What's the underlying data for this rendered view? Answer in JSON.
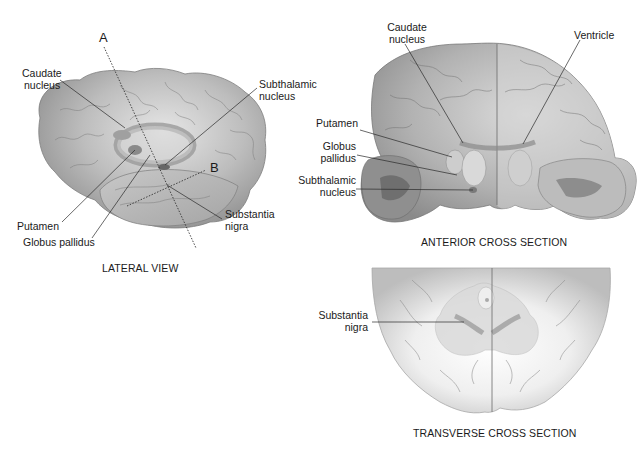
{
  "lateral_view": {
    "title": "LATERAL VIEW",
    "plane_labels": {
      "a": "A",
      "b": "B"
    },
    "labels": {
      "caudate_nucleus_1": "Caudate",
      "caudate_nucleus_2": "nucleus",
      "subthalamic_nucleus_1": "Subthalamic",
      "subthalamic_nucleus_2": "nucleus",
      "putamen": "Putamen",
      "globus_pallidus": "Globus pallidus",
      "substantia_nigra_1": "Substantia",
      "substantia_nigra_2": "nigra"
    }
  },
  "anterior_cross_section": {
    "title": "ANTERIOR CROSS SECTION",
    "labels": {
      "caudate_nucleus_1": "Caudate",
      "caudate_nucleus_2": "nucleus",
      "ventricle": "Ventricle",
      "putamen": "Putamen",
      "globus_pallidus_1": "Globus",
      "globus_pallidus_2": "pallidus",
      "subthalamic_nucleus_1": "Subthalamic",
      "subthalamic_nucleus_2": "nucleus"
    }
  },
  "transverse_cross_section": {
    "title": "TRANSVERSE CROSS SECTION",
    "labels": {
      "substantia_nigra_1": "Substantia",
      "substantia_nigra_2": "nigra"
    }
  },
  "colors": {
    "brain_dark": "#8e8e8e",
    "brain_mid": "#b4b4b4",
    "brain_light": "#e4e4e4",
    "nucleus_dark": "#7a7a7a",
    "leader_line": "#2a2a2a"
  }
}
